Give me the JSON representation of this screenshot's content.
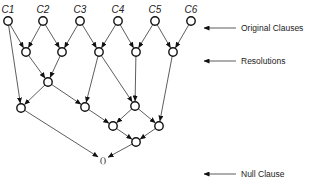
{
  "diagram": {
    "clauses": [
      {
        "id": "C1",
        "label": "C1",
        "x": 8,
        "y": 21
      },
      {
        "id": "C2",
        "label": "C2",
        "x": 43,
        "y": 21
      },
      {
        "id": "C3",
        "label": "C3",
        "x": 80,
        "y": 21
      },
      {
        "id": "C4",
        "label": "C4",
        "x": 118,
        "y": 21
      },
      {
        "id": "C5",
        "label": "C5",
        "x": 155,
        "y": 21
      },
      {
        "id": "C6",
        "label": "C6",
        "x": 191,
        "y": 21
      }
    ],
    "resolutions": [
      {
        "id": "R1",
        "x": 26,
        "y": 52
      },
      {
        "id": "R2",
        "x": 62,
        "y": 52
      },
      {
        "id": "R3",
        "x": 99,
        "y": 52
      },
      {
        "id": "R4",
        "x": 136,
        "y": 52
      },
      {
        "id": "R5",
        "x": 173,
        "y": 52
      },
      {
        "id": "R6",
        "x": 48,
        "y": 82
      },
      {
        "id": "R7",
        "x": 21,
        "y": 108
      },
      {
        "id": "R8",
        "x": 85,
        "y": 107
      },
      {
        "id": "R9",
        "x": 135,
        "y": 106
      },
      {
        "id": "R10",
        "x": 113,
        "y": 126
      },
      {
        "id": "R11",
        "x": 159,
        "y": 126
      },
      {
        "id": "R12",
        "x": 136,
        "y": 142
      }
    ],
    "null_clause": {
      "id": "NULL",
      "label": "()",
      "x": 103,
      "y": 163
    },
    "edges": [
      [
        "C1",
        "R1"
      ],
      [
        "C1",
        "R7"
      ],
      [
        "C2",
        "R1"
      ],
      [
        "C2",
        "R2"
      ],
      [
        "C3",
        "R2"
      ],
      [
        "C3",
        "R3"
      ],
      [
        "C4",
        "R3"
      ],
      [
        "C4",
        "R4"
      ],
      [
        "C5",
        "R4"
      ],
      [
        "C5",
        "R5"
      ],
      [
        "C6",
        "R5"
      ],
      [
        "R1",
        "R6"
      ],
      [
        "R2",
        "R6"
      ],
      [
        "R6",
        "R7"
      ],
      [
        "R6",
        "R8"
      ],
      [
        "R3",
        "R8"
      ],
      [
        "R3",
        "R9"
      ],
      [
        "R4",
        "R9"
      ],
      [
        "R5",
        "R11"
      ],
      [
        "R8",
        "R10"
      ],
      [
        "R9",
        "R10"
      ],
      [
        "R9",
        "R11"
      ],
      [
        "R10",
        "R12"
      ],
      [
        "R11",
        "R12"
      ],
      [
        "R7",
        "NULL"
      ],
      [
        "R12",
        "NULL"
      ]
    ]
  },
  "legend": [
    {
      "label": "Original Clauses",
      "y": 28
    },
    {
      "label": "Resolutions",
      "y": 61
    },
    {
      "label": "Null Clause",
      "y": 174
    }
  ]
}
